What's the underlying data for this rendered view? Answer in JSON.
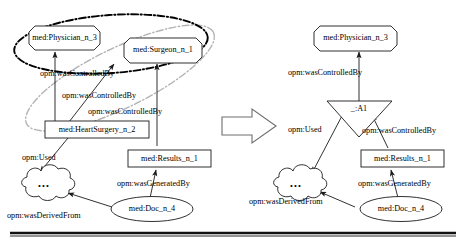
{
  "figure": {
    "left_panel": {
      "name": "original-graph",
      "nodes": [
        {
          "id": "physician_l",
          "label": "med:Physician_n_3",
          "shape": "octagon"
        },
        {
          "id": "surgeon_l",
          "label": "med:Surgeon_n_1",
          "shape": "octagon"
        },
        {
          "id": "heartsurgery_l",
          "label": "med:HeartSurgery_n_2",
          "shape": "rectangle"
        },
        {
          "id": "results_l",
          "label": "med:Results_n_1",
          "shape": "rectangle"
        },
        {
          "id": "cloud_l",
          "label": "•••",
          "shape": "cloud"
        },
        {
          "id": "doc_l",
          "label": "med:Doc_n_4",
          "shape": "ellipse"
        }
      ],
      "edges": [
        {
          "label": "opm:wasControlledBy",
          "from": "heartsurgery_l",
          "to": "physician_l"
        },
        {
          "label": "opm:wasControlledBy",
          "from": "heartsurgery_l",
          "to": "surgeon_l"
        },
        {
          "label": "opm:wasControlledBy",
          "from": "results_l",
          "to": "surgeon_l"
        },
        {
          "label": "opm:Used",
          "from": "heartsurgery_l",
          "to": "cloud_l"
        },
        {
          "label": "opm:wasGeneratedBy",
          "from": "doc_l",
          "to": "results_l"
        },
        {
          "label": "opm:wasDerivedFrom",
          "from": "doc_l",
          "to": "cloud_l"
        }
      ],
      "clusters": [
        {
          "name": "black-dashdot-ellipse",
          "color": "#000000",
          "style": "dash-dot"
        },
        {
          "name": "gray-dashdot-ellipse",
          "color": "#b3b3b3",
          "style": "dash-dot"
        }
      ]
    },
    "transform_arrow": {
      "name": "transformation-arrow",
      "direction": "right"
    },
    "right_panel": {
      "name": "transformed-graph",
      "nodes": [
        {
          "id": "physician_r",
          "label": "med:Physician_n_3",
          "shape": "octagon"
        },
        {
          "id": "a1_r",
          "label": "_:A1",
          "shape": "triangle-down"
        },
        {
          "id": "results_r",
          "label": "med:Results_n_1",
          "shape": "rectangle"
        },
        {
          "id": "cloud_r",
          "label": "•••",
          "shape": "cloud"
        },
        {
          "id": "doc_r",
          "label": "med:Doc_n_4",
          "shape": "ellipse"
        }
      ],
      "edges": [
        {
          "label": "opm:wasControlledBy",
          "from": "a1_r",
          "to": "physician_r"
        },
        {
          "label": "opm:Used",
          "from": "a1_r",
          "to": "cloud_r"
        },
        {
          "label": "opm:wasControlledBy",
          "from": "results_r",
          "to": "a1_r"
        },
        {
          "label": "opm:wasGeneratedBy",
          "from": "doc_r",
          "to": "results_r"
        },
        {
          "label": "opm:wasDerivedFrom",
          "from": "doc_r",
          "to": "cloud_r"
        }
      ]
    },
    "footer_rule": {
      "name": "bottom-horizontal-rule"
    }
  }
}
